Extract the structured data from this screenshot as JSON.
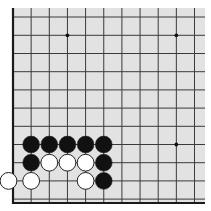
{
  "board": {
    "background": "#e2e2e2",
    "line_color": "#3a3a3a",
    "edge_color": "#1a1a1a",
    "area": {
      "x": 13,
      "y": 8,
      "w": 192,
      "h": 196
    },
    "origin_x": 13,
    "spacing": 18.15,
    "columns": 11,
    "row_ys": [
      17,
      35.3,
      53.5,
      71.7,
      89.9,
      108.1,
      126.3,
      144.5,
      162.7,
      180.9,
      199.1
    ],
    "bottom_edge_y": 203,
    "left_edge_x": 13,
    "edges": [
      "left",
      "bottom"
    ]
  },
  "star_points": [
    {
      "col": 3,
      "row": 1
    },
    {
      "col": 9,
      "row": 1
    },
    {
      "col": 9,
      "row": 7
    }
  ],
  "stones": [
    {
      "color": "black",
      "col": 1,
      "row": 7
    },
    {
      "color": "black",
      "col": 2,
      "row": 7
    },
    {
      "color": "black",
      "col": 3,
      "row": 7
    },
    {
      "color": "black",
      "col": 4,
      "row": 7
    },
    {
      "color": "black",
      "col": 5,
      "row": 7
    },
    {
      "color": "black",
      "col": 1,
      "row": 8
    },
    {
      "color": "white",
      "col": 2,
      "row": 8
    },
    {
      "color": "white",
      "col": 3,
      "row": 8
    },
    {
      "color": "white",
      "col": 4,
      "row": 8
    },
    {
      "color": "black",
      "col": 5,
      "row": 8
    },
    {
      "color": "white",
      "col": 0,
      "row": 9
    },
    {
      "color": "white",
      "col": 1,
      "row": 9
    },
    {
      "color": "white",
      "col": 4,
      "row": 9
    },
    {
      "color": "black",
      "col": 5,
      "row": 9
    }
  ],
  "stone_colors": {
    "black": "#111111",
    "white": "#ffffff",
    "outline": "#222222"
  }
}
